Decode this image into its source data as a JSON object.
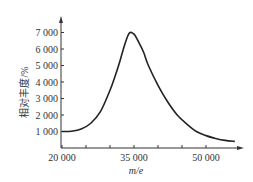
{
  "chart_data": {
    "type": "line",
    "title": "",
    "xlabel": "m/e",
    "ylabel": "相对丰度/%",
    "x_ticks": [
      20000,
      35000,
      50000
    ],
    "x_tick_labels": [
      "20 000",
      "35 000",
      "50 000"
    ],
    "x_minor_ticks": [
      25000,
      30000,
      40000,
      45000
    ],
    "y_ticks": [
      1000,
      2000,
      3000,
      4000,
      5000,
      6000,
      7000
    ],
    "y_tick_labels": [
      "1 000",
      "2 000",
      "3 000",
      "4 000",
      "5 000",
      "6 000",
      "7 000"
    ],
    "xlim": [
      20000,
      57000
    ],
    "ylim": [
      0,
      7600
    ],
    "grid": false,
    "legend": null,
    "series": [
      {
        "name": "mass spectrum",
        "x": [
          20000,
          22000,
          24000,
          26000,
          28000,
          30000,
          31000,
          32000,
          33000,
          34000,
          35000,
          36000,
          37000,
          38000,
          40000,
          42000,
          44000,
          46000,
          48000,
          50000,
          52000,
          54000,
          56000
        ],
        "y": [
          1000,
          1020,
          1150,
          1500,
          2200,
          3500,
          4300,
          5200,
          6200,
          6950,
          6900,
          6400,
          5800,
          5000,
          3800,
          2800,
          2000,
          1450,
          1000,
          750,
          580,
          460,
          400
        ]
      }
    ]
  },
  "colors": {
    "line": "#222222",
    "axis": "#333333"
  }
}
